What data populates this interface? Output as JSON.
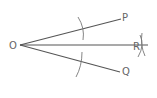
{
  "diagram": {
    "points": {
      "O": {
        "label": "O",
        "x": 20,
        "y": 45
      },
      "P": {
        "label": "P",
        "x": 121,
        "y": 19
      },
      "Q": {
        "label": "Q",
        "x": 120,
        "y": 72
      },
      "R": {
        "label": "R",
        "x": 146,
        "y": 45
      }
    },
    "segments": [
      {
        "from": "O",
        "to": "P"
      },
      {
        "from": "O",
        "to": "Q"
      },
      {
        "from": "O",
        "to": "R"
      }
    ],
    "colors": {
      "line": "#555555",
      "arc": "#777777",
      "label": "#666666"
    }
  }
}
